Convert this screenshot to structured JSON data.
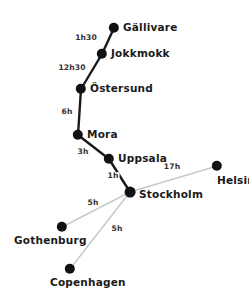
{
  "diagram": {
    "colors": {
      "node": "#111111",
      "edge_primary": "#1a1a1a",
      "edge_secondary": "#c9c9c9",
      "background": "#ffffff",
      "text": "#1a1a1a"
    },
    "nodes": [
      {
        "id": "gallivare",
        "label": "Gällivare",
        "x": 114,
        "y": 28,
        "r": 5.2,
        "label_x": 123,
        "label_y": 27
      },
      {
        "id": "jokkmokk",
        "label": "Jokkmokk",
        "x": 102,
        "y": 54,
        "r": 5.2,
        "label_x": 111,
        "label_y": 53
      },
      {
        "id": "ostersund",
        "label": "Östersund",
        "x": 81,
        "y": 89,
        "r": 5.2,
        "label_x": 90,
        "label_y": 88
      },
      {
        "id": "mora",
        "label": "Mora",
        "x": 78,
        "y": 135,
        "r": 5.2,
        "label_x": 87,
        "label_y": 134
      },
      {
        "id": "uppsala",
        "label": "Uppsala",
        "x": 109,
        "y": 159,
        "r": 5.2,
        "label_x": 118,
        "label_y": 158
      },
      {
        "id": "stockholm",
        "label": "Stockholm",
        "x": 130,
        "y": 192,
        "r": 5.4,
        "label_x": 139,
        "label_y": 194
      },
      {
        "id": "helsinki",
        "label": "Helsinki",
        "x": 217,
        "y": 166,
        "r": 5.2,
        "label_x": 217,
        "label_y": 180
      },
      {
        "id": "gothenburg",
        "label": "Gothenburg",
        "x": 62,
        "y": 227,
        "r": 5.2,
        "label_x": 14,
        "label_y": 240
      },
      {
        "id": "copenhagen",
        "label": "Copenhagen",
        "x": 70,
        "y": 269,
        "r": 5.2,
        "label_x": 50,
        "label_y": 282
      }
    ],
    "edges": [
      {
        "id": "gallivare-jokkmokk",
        "from": "gallivare",
        "to": "jokkmokk",
        "duration": "1h30",
        "style": "primary",
        "label_x": 86,
        "label_y": 38
      },
      {
        "id": "jokkmokk-ostersund",
        "from": "jokkmokk",
        "to": "ostersund",
        "duration": "12h30",
        "style": "primary",
        "label_x": 72,
        "label_y": 68
      },
      {
        "id": "ostersund-mora",
        "from": "ostersund",
        "to": "mora",
        "duration": "6h",
        "style": "primary",
        "label_x": 67,
        "label_y": 112
      },
      {
        "id": "mora-uppsala",
        "from": "mora",
        "to": "uppsala",
        "duration": "3h",
        "style": "primary",
        "label_x": 83,
        "label_y": 152
      },
      {
        "id": "uppsala-stockholm",
        "from": "uppsala",
        "to": "stockholm",
        "duration": "1h",
        "style": "primary",
        "label_x": 113,
        "label_y": 176
      },
      {
        "id": "stockholm-helsinki",
        "from": "stockholm",
        "to": "helsinki",
        "duration": "17h",
        "style": "secondary",
        "label_x": 172,
        "label_y": 167
      },
      {
        "id": "stockholm-gothenburg",
        "from": "stockholm",
        "to": "gothenburg",
        "duration": "5h",
        "style": "secondary",
        "label_x": 93,
        "label_y": 203
      },
      {
        "id": "stockholm-copenhagen",
        "from": "stockholm",
        "to": "copenhagen",
        "duration": "5h",
        "style": "secondary",
        "label_x": 117,
        "label_y": 229
      }
    ]
  }
}
